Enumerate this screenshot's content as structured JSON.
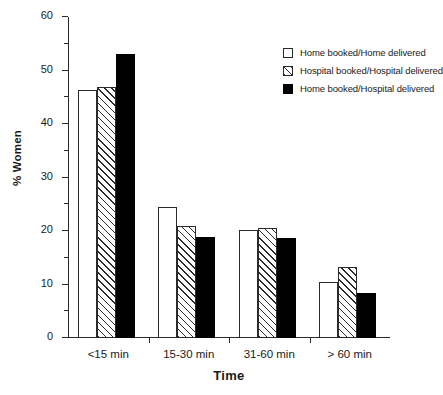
{
  "chart_data": {
    "type": "bar",
    "title": "",
    "xlabel": "Time",
    "ylabel": "% Women",
    "categories": [
      "<15  min",
      "15-30 min",
      "31-60 min",
      "> 60 min"
    ],
    "series": [
      {
        "name": "Home booked/Home delivered",
        "pattern": "open",
        "color": "#ffffff",
        "values": [
          46.4,
          24.5,
          20.1,
          10.4
        ]
      },
      {
        "name": "Hospital booked/Hospital delivered",
        "pattern": "hatch",
        "color": "#ffffff",
        "values": [
          47.0,
          21.0,
          20.5,
          13.2
        ]
      },
      {
        "name": "Home booked/Hospital delivered",
        "pattern": "solid",
        "color": "#000000",
        "values": [
          53.0,
          18.9,
          18.7,
          8.4
        ]
      }
    ],
    "ylim": [
      0,
      60
    ],
    "yticks": [
      0,
      10,
      20,
      30,
      40,
      50,
      60
    ],
    "ytick_labels": [
      "0",
      "10",
      "20",
      "30",
      "40",
      "50",
      "60"
    ],
    "yminor_ticks": [
      5,
      15,
      25,
      35,
      45,
      55
    ],
    "grid": false,
    "legend_position": "top-right",
    "axis_color": "#2a2a2a"
  },
  "legend": {
    "entries": [
      "Home booked/Home delivered",
      "Hospital booked/Hospital delivered",
      "Home booked/Hospital delivered"
    ]
  }
}
